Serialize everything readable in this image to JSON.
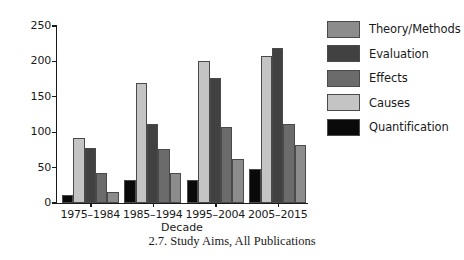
{
  "caption": "2.7.  Study Aims, All Publications",
  "chart_data": {
    "type": "bar",
    "title": "",
    "xlabel": "Decade",
    "ylabel": "Publications",
    "categories": [
      "1975–1984",
      "1985–1994",
      "1995–2004",
      "2005–2015"
    ],
    "ylim": [
      0,
      250
    ],
    "yticks": [
      0,
      50,
      100,
      150,
      200,
      250
    ],
    "ytick_labels": [
      "0",
      "50",
      "100",
      "150",
      "200",
      "250"
    ],
    "grid": false,
    "legend_position": "right",
    "bar_draw_order": [
      "Quantification",
      "Causes",
      "Evaluation",
      "Effects",
      "Theory/Methods"
    ],
    "series": [
      {
        "name": "Theory/Methods",
        "color": "#8c8c8c",
        "values": [
          16,
          42,
          62,
          82
        ]
      },
      {
        "name": "Evaluation",
        "color": "#414141",
        "values": [
          78,
          112,
          177,
          219
        ]
      },
      {
        "name": "Effects",
        "color": "#6b6b6b",
        "values": [
          42,
          76,
          107,
          112
        ]
      },
      {
        "name": "Causes",
        "color": "#c4c4c4",
        "values": [
          92,
          169,
          200,
          208
        ]
      },
      {
        "name": "Quantification",
        "color": "#0a0a0a",
        "values": [
          11,
          32,
          33,
          48
        ]
      }
    ]
  }
}
